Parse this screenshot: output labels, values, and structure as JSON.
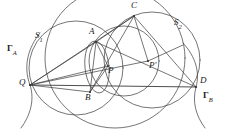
{
  "figure": {
    "kind": "euclidean-geometry-diagram",
    "width": 229,
    "height": 129,
    "background_color": "#ffffff",
    "stroke_color": "#3a3a3a",
    "label_color": "#1a1a1a"
  },
  "labels": {
    "gamma_a": "Γ",
    "gamma_a_sub": "A",
    "gamma_b": "Γ",
    "gamma_b_sub": "B",
    "s1": "S",
    "s1_sub": "1",
    "s2": "S",
    "s2_sub": "2",
    "point_a": "A",
    "point_b": "B",
    "point_c": "C",
    "point_d": "D",
    "point_q": "Q",
    "point_p": "P",
    "point_p_prime": "P′"
  },
  "points": {
    "Q": {
      "x": 30,
      "y": 85,
      "label": "Q",
      "label_x": 20,
      "label_y": 79
    },
    "A": {
      "x": 96,
      "y": 42,
      "label": "A",
      "label_x": 88,
      "label_y": 28
    },
    "B": {
      "x": 90,
      "y": 92,
      "label": "B",
      "label_x": 84,
      "label_y": 92
    },
    "C": {
      "x": 134,
      "y": 16,
      "label": "C",
      "label_x": 130,
      "label_y": 2
    },
    "D": {
      "x": 196,
      "y": 87,
      "label": "D",
      "label_x": 200,
      "label_y": 77
    },
    "P": {
      "x": 108,
      "y": 66,
      "label": "P",
      "label_x": 108,
      "label_y": 66
    },
    "Pprime": {
      "x": 148,
      "y": 61,
      "label": "P′",
      "label_x": 150,
      "label_y": 61
    }
  },
  "circles": [
    {
      "name": "S1",
      "cx": 75,
      "cy": 69,
      "r": 46,
      "label": "S₁"
    },
    {
      "name": "S2",
      "cx": 155,
      "cy": 57,
      "r": 49,
      "label": "S₂"
    },
    {
      "name": "circle-through-A-B-C-D",
      "cx": 124,
      "cy": 62,
      "r": 34
    },
    {
      "name": "circle-through-Q-B-D-large",
      "cx": 114,
      "cy": 57,
      "r": 69
    },
    {
      "name": "small-circle-A-P-B",
      "cx": 97,
      "cy": 67,
      "r": 25
    }
  ],
  "arcs": [
    {
      "name": "Gamma-A",
      "label": "Γₐ",
      "through": [
        "Q"
      ]
    },
    {
      "name": "Gamma-B",
      "label": "Γв",
      "through": [
        "D"
      ]
    }
  ],
  "segments": [
    {
      "name": "Q-D-baseline",
      "from": "Q",
      "to": "D"
    },
    {
      "name": "Q-A",
      "from": "Q",
      "to": "A"
    },
    {
      "name": "Q-C",
      "from": "Q",
      "to": "C"
    },
    {
      "name": "Q-P",
      "from": "Q",
      "to": "P"
    },
    {
      "name": "Q-Pprime",
      "from": "Q",
      "to": "Pprime"
    },
    {
      "name": "Q-B",
      "from": "Q",
      "to": "B"
    },
    {
      "name": "A-C",
      "from": "A",
      "to": "C"
    },
    {
      "name": "A-P",
      "from": "A",
      "to": "P"
    },
    {
      "name": "A-B",
      "from": "A",
      "to": "B"
    },
    {
      "name": "C-D",
      "from": "C",
      "to": "D"
    },
    {
      "name": "C-B",
      "from": "C",
      "to": "B"
    },
    {
      "name": "C-Pprime",
      "from": "C",
      "to": "Pprime"
    },
    {
      "name": "B-P",
      "from": "B",
      "to": "P"
    },
    {
      "name": "Pprime-D",
      "from": "Pprime",
      "to": "D"
    },
    {
      "name": "A-D",
      "from": "A",
      "to": "D"
    }
  ]
}
